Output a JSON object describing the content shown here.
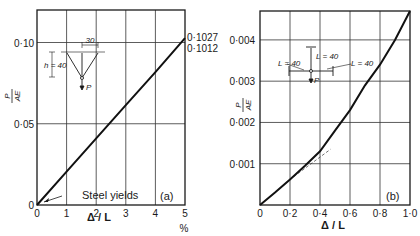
{
  "chart_data": [
    {
      "panel": "(a)",
      "type": "line",
      "title": "",
      "xlabel": "Δ / L",
      "xunit": "%",
      "ylabel": "P / AE",
      "xlim": [
        0,
        5
      ],
      "ylim": [
        0,
        0.12
      ],
      "xticks": [
        "0",
        "1",
        "2",
        "3",
        "4",
        "5"
      ],
      "yticks": [
        "0",
        "0·05",
        "0·10"
      ],
      "grid": true,
      "series": [
        {
          "name": "P/AE",
          "x": [
            0,
            1,
            2,
            3,
            4,
            5
          ],
          "y": [
            0,
            0.0205,
            0.041,
            0.0614,
            0.0818,
            0.1027
          ]
        }
      ],
      "annotations": {
        "end_upper": "0·1027",
        "end_lower": "0·1012",
        "yield_note": "Steel yields",
        "panel_label": "(a)",
        "inset_width": "30",
        "inset_height": "h = 40",
        "inset_load": "P"
      }
    },
    {
      "panel": "(b)",
      "type": "line",
      "title": "",
      "xlabel": "Δ / L",
      "ylabel": "P / AE",
      "xlim": [
        0,
        1.0
      ],
      "ylim": [
        0,
        0.0047
      ],
      "xticks": [
        "0",
        "0·2",
        "0·4",
        "0·6",
        "0·8",
        "1·0"
      ],
      "yticks": [
        "0·001",
        "0·002",
        "0·003",
        "0·004"
      ],
      "grid": true,
      "series": [
        {
          "name": "P/AE",
          "x": [
            0,
            0.1,
            0.2,
            0.3,
            0.4,
            0.5,
            0.6,
            0.7,
            0.8,
            0.9,
            1.0
          ],
          "y": [
            0,
            0.0003,
            0.00062,
            0.00095,
            0.0013,
            0.0018,
            0.0023,
            0.0029,
            0.0034,
            0.004,
            0.0047
          ]
        },
        {
          "name": "tangent (dashed)",
          "x": [
            0.2,
            0.47
          ],
          "y": [
            0.00062,
            0.00135
          ]
        }
      ],
      "annotations": {
        "panel_label": "(b)",
        "inset_L_left": "L = 40",
        "inset_L_top": "L = 40",
        "inset_L_right": "L = 40",
        "inset_load": "P"
      }
    }
  ]
}
